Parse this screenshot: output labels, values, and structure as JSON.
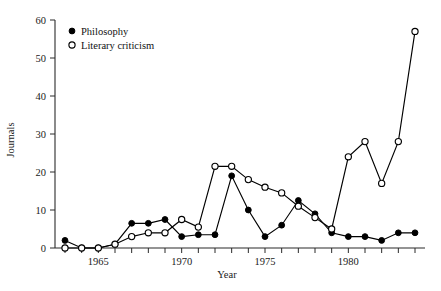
{
  "chart_data": {
    "type": "line",
    "title": "",
    "xlabel": "Year",
    "ylabel": "Journals",
    "xlim": [
      1962.4,
      1984.6
    ],
    "ylim": [
      0,
      60
    ],
    "grid": false,
    "legend_position": "top-left-inside",
    "x": [
      1963,
      1964,
      1965,
      1966,
      1967,
      1968,
      1969,
      1970,
      1971,
      1972,
      1973,
      1974,
      1975,
      1976,
      1977,
      1978,
      1979,
      1980,
      1981,
      1982,
      1983,
      1984
    ],
    "xticks": [
      1963,
      1964,
      1965,
      1966,
      1967,
      1968,
      1969,
      1970,
      1971,
      1972,
      1973,
      1974,
      1975,
      1976,
      1977,
      1978,
      1979,
      1980,
      1981,
      1982,
      1983,
      1984
    ],
    "xtick_labels": [
      "",
      "",
      "1965",
      "",
      "",
      "",
      "",
      "1970",
      "",
      "",
      "",
      "",
      "1975",
      "",
      "",
      "",
      "",
      "1980",
      "",
      "",
      "",
      ""
    ],
    "yticks": [
      0,
      10,
      20,
      30,
      40,
      50,
      60
    ],
    "ytick_labels": [
      "0",
      "10",
      "20",
      "30",
      "40",
      "50",
      "60"
    ],
    "series": [
      {
        "name": "Philosophy",
        "marker": "filled-circle",
        "values": [
          2,
          0,
          0,
          1,
          6.5,
          6.5,
          7.5,
          3,
          3.5,
          3.5,
          19,
          10,
          3,
          6,
          12.5,
          9,
          4,
          3,
          3,
          2,
          4,
          4
        ]
      },
      {
        "name": "Literary criticism",
        "marker": "open-circle",
        "values": [
          0,
          0,
          0,
          1,
          3,
          4,
          4,
          7.5,
          5.5,
          21.5,
          21.5,
          18,
          16,
          14.5,
          11,
          8,
          5,
          24,
          28,
          17,
          28,
          57
        ]
      }
    ]
  },
  "legend": {
    "items": [
      {
        "label": "Philosophy",
        "marker": "filled-circle"
      },
      {
        "label": "Literary criticism",
        "marker": "open-circle"
      }
    ]
  },
  "colors": {
    "line": "#000000",
    "axis": "#2b2b2b",
    "background": "#ffffff",
    "marker_fill_open": "#ffffff"
  }
}
